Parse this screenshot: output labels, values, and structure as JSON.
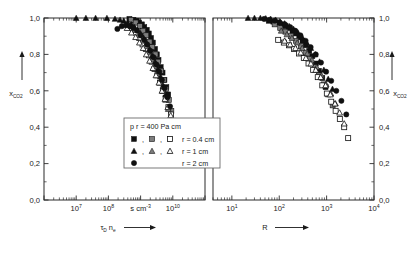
{
  "figure": {
    "axis_y_label": "x",
    "axis_y_sub": "CO",
    "axis_y_sub2": "2",
    "y_ticks": [
      "1,0",
      "0,8",
      "0,6",
      "0,4",
      "0,2",
      "0,0"
    ],
    "y_values": [
      1.0,
      0.8,
      0.6,
      0.4,
      0.2,
      0.0
    ]
  },
  "left_panel": {
    "xlabel_main": "τ",
    "xlabel_sub": "D",
    "xlabel_main2": "n",
    "xlabel_sub2": "e",
    "xlabel_arrow": "⟶",
    "unit_label": "s cm",
    "unit_exp": "-3",
    "x_tick_labels": [
      "10",
      "10",
      "10"
    ],
    "x_tick_exps": [
      "7",
      "8",
      "10"
    ]
  },
  "right_panel": {
    "xlabel_main": "R",
    "xlabel_arrow": "⟶",
    "x_tick_labels": [
      "10",
      "10",
      "10",
      "10"
    ],
    "x_tick_exps": [
      "1",
      "2",
      "3",
      "4"
    ]
  },
  "legend": {
    "title_pre": "p r = 400 Pa cm",
    "separator": ",",
    "entries": [
      {
        "label": "r = 0.4 cm",
        "markers": [
          "square-filled",
          "square-half",
          "square-open"
        ]
      },
      {
        "label": "r = 1 cm",
        "markers": [
          "triangle-filled",
          "triangle-half",
          "triangle-open"
        ]
      },
      {
        "label": "r = 2 cm",
        "markers": [
          "circle-filled"
        ]
      }
    ]
  },
  "chart_data": {
    "type": "scatter",
    "title": "",
    "panels": [
      {
        "name": "left",
        "xlabel": "τ_D n_e",
        "xunit": "s cm^-3",
        "ylabel": "x_CO2",
        "xscale": "log",
        "xlim": [
          1000000,
          100000000000
        ],
        "ylim": [
          0.0,
          1.0
        ],
        "xticks": [
          10000000,
          100000000,
          1000000000,
          10000000000
        ],
        "xticklabels": [
          "10^7",
          "10^8",
          "s cm^-3",
          "10^10"
        ],
        "yticks": [
          0.0,
          0.2,
          0.4,
          0.6,
          0.8,
          1.0
        ],
        "grid": false,
        "series": [
          {
            "name": "r = 0.4 cm, square-filled",
            "marker": "square-filled",
            "x": [
              450000000.0,
              600000000.0,
              750000000.0,
              900000000.0,
              1100000000.0,
              1300000000.0,
              1550000000.0,
              1800000000.0,
              2100000000.0,
              2400000000.0,
              2800000000.0,
              3200000000.0,
              3600000000.0,
              4200000000.0,
              4800000000.0,
              5500000000.0,
              6300000000.0,
              7200000000.0
            ],
            "y": [
              0.995,
              0.99,
              0.985,
              0.975,
              0.965,
              0.95,
              0.935,
              0.915,
              0.89,
              0.865,
              0.83,
              0.8,
              0.77,
              0.73,
              0.7,
              0.66,
              0.62,
              0.58
            ]
          },
          {
            "name": "r = 0.4 cm, square-half",
            "marker": "square-half",
            "x": [
              500000000.0,
              700000000.0,
              950000000.0,
              1200000000.0,
              1500000000.0,
              1900000000.0,
              2300000000.0,
              2900000000.0,
              3500000000.0,
              4300000000.0,
              5200000000.0,
              6200000000.0,
              7500000000.0,
              9000000000.0
            ],
            "y": [
              0.99,
              0.975,
              0.955,
              0.93,
              0.905,
              0.87,
              0.84,
              0.8,
              0.76,
              0.71,
              0.66,
              0.61,
              0.55,
              0.49
            ]
          },
          {
            "name": "r = 0.4 cm, square-open",
            "marker": "square-open",
            "x": [
              400000000.0,
              550000000.0,
              720000000.0,
              900000000.0,
              1150000000.0,
              1450000000.0,
              1800000000.0,
              2200000000.0,
              2700000000.0,
              3300000000.0,
              4000000000.0,
              4900000000.0,
              6000000000.0,
              7300000000.0,
              8800000000.0,
              10500000000.0,
              12500000000.0,
              14500000000.0,
              17000000000.0
            ],
            "y": [
              0.965,
              0.945,
              0.92,
              0.89,
              0.855,
              0.83,
              0.795,
              0.76,
              0.72,
              0.685,
              0.645,
              0.6,
              0.56,
              0.51,
              0.47,
              0.435,
              0.405,
              0.375,
              0.335
            ]
          },
          {
            "name": "r = 1 cm, triangle-filled",
            "marker": "triangle-filled",
            "x": [
              10000000.0,
              20000000.0,
              40000000.0,
              90000000.0,
              160000000.0,
              230000000.0,
              300000000.0,
              400000000.0,
              520000000.0,
              650000000.0,
              800000000.0,
              1000000000.0,
              1250000000.0,
              1550000000.0,
              1900000000.0,
              2300000000.0,
              2800000000.0,
              3400000000.0,
              4100000000.0,
              5000000000.0,
              6000000000.0
            ],
            "y": [
              1.0,
              1.0,
              1.0,
              1.0,
              0.995,
              0.99,
              0.985,
              0.975,
              0.965,
              0.95,
              0.935,
              0.915,
              0.89,
              0.86,
              0.83,
              0.795,
              0.76,
              0.72,
              0.68,
              0.63,
              0.58
            ]
          },
          {
            "name": "r = 1 cm, triangle-half",
            "marker": "triangle-half",
            "x": [
              420000000.0,
              600000000.0,
              850000000.0,
              1100000000.0,
              1400000000.0,
              1750000000.0,
              2200000000.0,
              2700000000.0,
              3300000000.0,
              4000000000.0,
              4900000000.0,
              6000000000.0,
              7200000000.0
            ],
            "y": [
              0.955,
              0.935,
              0.905,
              0.875,
              0.845,
              0.81,
              0.775,
              0.735,
              0.695,
              0.65,
              0.6,
              0.55,
              0.5
            ]
          },
          {
            "name": "r = 1 cm, triangle-open",
            "marker": "triangle-open",
            "x": [
              380000000.0,
              520000000.0,
              700000000.0,
              920000000.0,
              1200000000.0,
              1500000000.0,
              1900000000.0,
              2400000000.0,
              3000000000.0,
              3700000000.0,
              4600000000.0,
              5700000000.0,
              7000000000.0,
              8600000000.0,
              10500000000.0,
              13000000000.0,
              15500000000.0
            ],
            "y": [
              0.945,
              0.92,
              0.895,
              0.865,
              0.835,
              0.8,
              0.765,
              0.725,
              0.685,
              0.645,
              0.6,
              0.555,
              0.51,
              0.465,
              0.425,
              0.39,
              0.355
            ]
          },
          {
            "name": "r = 2 cm, circle-filled",
            "marker": "circle-filled",
            "x": [
              190000000.0,
              260000000.0,
              350000000.0,
              460000000.0,
              600000000.0,
              780000000.0,
              1000000000.0,
              1300000000.0,
              1600000000.0,
              2000000000.0,
              2500000000.0,
              3100000000.0,
              3800000000.0,
              4600000000.0,
              5600000000.0,
              6800000000.0,
              8200000000.0
            ],
            "y": [
              0.94,
              0.955,
              0.96,
              0.955,
              0.945,
              0.93,
              0.905,
              0.88,
              0.855,
              0.82,
              0.785,
              0.745,
              0.705,
              0.66,
              0.615,
              0.565,
              0.515
            ]
          }
        ]
      },
      {
        "name": "right",
        "xlabel": "R",
        "ylabel": "x_CO2",
        "xscale": "log",
        "xlim": [
          4,
          10000
        ],
        "ylim": [
          0.0,
          1.0
        ],
        "xticks": [
          10,
          100,
          1000,
          10000
        ],
        "xticklabels": [
          "10^1",
          "10^2",
          "10^3",
          "10^4"
        ],
        "yticks": [
          0.0,
          0.2,
          0.4,
          0.6,
          0.8,
          1.0
        ],
        "grid": false,
        "series": [
          {
            "name": "r = 0.4 cm, square-filled",
            "marker": "square-filled",
            "x": [
              60,
              75,
              92,
              112,
              135,
              160,
              190,
              225,
              265,
              310,
              365,
              430,
              500,
              590,
              690,
              810,
              950
            ],
            "y": [
              0.985,
              0.98,
              0.975,
              0.965,
              0.955,
              0.945,
              0.93,
              0.915,
              0.895,
              0.875,
              0.85,
              0.82,
              0.79,
              0.75,
              0.71,
              0.67,
              0.62
            ]
          },
          {
            "name": "r = 0.4 cm, square-half",
            "marker": "square-half",
            "x": [
              80,
              105,
              135,
              175,
              225,
              285,
              360,
              450,
              560,
              700,
              870,
              1080,
              1340
            ],
            "y": [
              0.965,
              0.945,
              0.925,
              0.9,
              0.875,
              0.845,
              0.81,
              0.775,
              0.73,
              0.685,
              0.635,
              0.58,
              0.52
            ]
          },
          {
            "name": "r = 0.4 cm, square-open",
            "marker": "square-open",
            "x": [
              95,
              125,
              160,
              205,
              260,
              330,
              415,
              520,
              650,
              810,
              1010,
              1250,
              1550,
              1900,
              2350,
              2850
            ],
            "y": [
              0.88,
              0.865,
              0.85,
              0.83,
              0.805,
              0.78,
              0.75,
              0.715,
              0.675,
              0.63,
              0.585,
              0.54,
              0.49,
              0.445,
              0.4,
              0.34
            ]
          },
          {
            "name": "r = 1 cm, triangle-filled",
            "marker": "triangle-filled",
            "x": [
              22,
              30,
              40,
              52,
              66,
              84,
              105,
              130,
              162,
              200,
              248,
              305,
              378,
              465,
              575,
              710,
              875,
              1080,
              1330
            ],
            "y": [
              1.0,
              1.0,
              1.0,
              0.998,
              0.995,
              0.99,
              0.98,
              0.97,
              0.955,
              0.94,
              0.92,
              0.895,
              0.865,
              0.835,
              0.8,
              0.76,
              0.715,
              0.665,
              0.61
            ]
          },
          {
            "name": "r = 1 cm, triangle-half",
            "marker": "triangle-half",
            "x": [
              110,
              145,
              185,
              240,
              305,
              390,
              490,
              620,
              780,
              980,
              1230,
              1540
            ],
            "y": [
              0.93,
              0.91,
              0.89,
              0.865,
              0.835,
              0.805,
              0.77,
              0.73,
              0.685,
              0.635,
              0.585,
              0.53
            ]
          },
          {
            "name": "r = 1 cm, triangle-open",
            "marker": "triangle-open",
            "x": [
              130,
              170,
              220,
              285,
              365,
              465,
              590,
              750,
              950,
              1200,
              1500,
              1880,
              2350
            ],
            "y": [
              0.875,
              0.855,
              0.835,
              0.81,
              0.78,
              0.75,
              0.715,
              0.675,
              0.63,
              0.58,
              0.53,
              0.48,
              0.42
            ]
          },
          {
            "name": "r = 2 cm, circle-filled",
            "marker": "circle-filled",
            "x": [
              48,
              62,
              80,
              103,
              132,
              170,
              218,
              280,
              360,
              460,
              590,
              760,
              975,
              1250,
              1600,
              2050,
              2600
            ],
            "y": [
              0.995,
              0.99,
              0.985,
              0.975,
              0.965,
              0.95,
              0.93,
              0.905,
              0.875,
              0.84,
              0.8,
              0.755,
              0.705,
              0.655,
              0.6,
              0.545,
              0.47
            ]
          }
        ]
      }
    ]
  }
}
